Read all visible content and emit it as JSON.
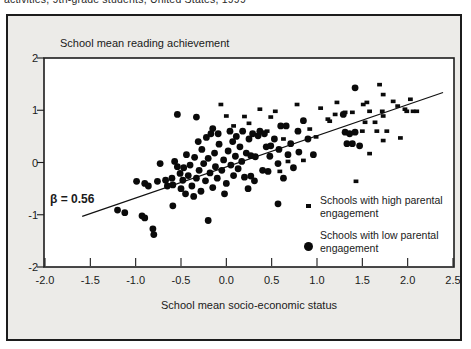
{
  "page": {
    "caption_clipped": "activities, 9th-grade students, United States, 1999"
  },
  "chart_ui": {
    "title": "School mean reading achievement",
    "x_axis_title": "School mean socio-economic status",
    "beta_annotation": "β = 0.56",
    "legend": [
      {
        "marker": "small-square",
        "line1": "Schools with high parental",
        "line2": "engagement"
      },
      {
        "marker": "large-circle",
        "line1": "Schools with low parental",
        "line2": "engagement"
      }
    ],
    "colors": {
      "box_background": "#ecebe8",
      "plot_background": "#ffffff",
      "marker": "#0a0a0a",
      "frame": "#1c1c1c"
    }
  },
  "chart_data": {
    "type": "scatter",
    "title": "School mean reading achievement",
    "xlabel": "School mean socio-economic status",
    "ylabel": "",
    "xlim": [
      -2.0,
      2.5
    ],
    "ylim": [
      -2,
      2
    ],
    "x_ticks": [
      -2.0,
      -1.5,
      -1.0,
      -0.5,
      0.0,
      0.5,
      1.0,
      1.5,
      2.0,
      2.5
    ],
    "x_tick_labels": [
      "-2.0",
      "-1.5",
      "-1.0",
      "-0.5",
      "0.0",
      "0.5",
      "1.0",
      "1.5",
      "2.0",
      "2.5"
    ],
    "y_ticks": [
      2,
      1,
      0,
      -1,
      -2
    ],
    "y_tick_labels": [
      "2",
      "1",
      "0",
      "-1",
      "-2"
    ],
    "grid": false,
    "legend_position": "inside-lower-right",
    "annotation": {
      "text": "β = 0.56",
      "x": -1.55,
      "y": -0.6
    },
    "regression_line": {
      "beta": 0.56,
      "x1": -1.59,
      "y1": -1.03,
      "x2": 2.39,
      "y2": 1.34
    },
    "series": [
      {
        "name": "Schools with high parental engagement",
        "marker": "square",
        "points": [
          [
            -0.06,
            1.11
          ],
          [
            0.0,
            0.89
          ],
          [
            0.08,
            0.7
          ],
          [
            0.2,
            0.88
          ],
          [
            0.25,
            0.75
          ],
          [
            0.37,
            1.02
          ],
          [
            0.45,
            0.6
          ],
          [
            0.49,
            0.87
          ],
          [
            0.54,
            0.98
          ],
          [
            0.59,
            -0.17
          ],
          [
            0.63,
            0.45
          ],
          [
            0.68,
            0.02
          ],
          [
            0.78,
            1.11
          ],
          [
            0.85,
            0.04
          ],
          [
            0.92,
            0.64
          ],
          [
            0.99,
            0.49
          ],
          [
            1.04,
            1.04
          ],
          [
            1.12,
            0.83
          ],
          [
            1.14,
            0.79
          ],
          [
            1.2,
            0.92
          ],
          [
            1.22,
            1.15
          ],
          [
            1.31,
            0.96
          ],
          [
            1.39,
            0.96
          ],
          [
            1.43,
            -0.36
          ],
          [
            1.5,
            0.6
          ],
          [
            1.51,
            1.11
          ],
          [
            1.53,
            0.77
          ],
          [
            1.55,
            1.15
          ],
          [
            1.58,
            0.98
          ],
          [
            1.58,
            0.17
          ],
          [
            1.64,
            0.77
          ],
          [
            1.66,
            0.6
          ],
          [
            1.69,
            1.49
          ],
          [
            1.72,
            0.98
          ],
          [
            1.73,
            0.89
          ],
          [
            1.73,
            0.42
          ],
          [
            1.73,
            1.3
          ],
          [
            1.77,
            0.6
          ],
          [
            1.84,
            1.17
          ],
          [
            1.89,
            1.08
          ],
          [
            1.92,
            0.47
          ],
          [
            1.97,
            1.02
          ],
          [
            1.99,
            0.98
          ],
          [
            2.03,
            1.21
          ],
          [
            2.06,
            0.98
          ],
          [
            2.1,
            0.98
          ]
        ]
      },
      {
        "name": "Schools with low parental engagement",
        "marker": "circle",
        "points": [
          [
            -1.2,
            -0.91
          ],
          [
            -1.12,
            -0.96
          ],
          [
            -0.99,
            -0.36
          ],
          [
            -0.93,
            -1.02
          ],
          [
            -0.9,
            -0.4
          ],
          [
            -0.9,
            -1.06
          ],
          [
            -0.86,
            -0.45
          ],
          [
            -0.81,
            -1.27
          ],
          [
            -0.8,
            -1.38
          ],
          [
            -0.76,
            -0.36
          ],
          [
            -0.73,
            -0.02
          ],
          [
            -0.67,
            -0.34
          ],
          [
            -0.65,
            -0.45
          ],
          [
            -0.6,
            -0.3
          ],
          [
            -0.59,
            -0.83
          ],
          [
            -0.59,
            -0.43
          ],
          [
            -0.57,
            0.02
          ],
          [
            -0.54,
            -0.08
          ],
          [
            -0.54,
            0.92
          ],
          [
            -0.51,
            -0.21
          ],
          [
            -0.5,
            -0.5
          ],
          [
            -0.48,
            -0.34
          ],
          [
            -0.47,
            -0.1
          ],
          [
            -0.45,
            -0.6
          ],
          [
            -0.44,
            0.15
          ],
          [
            -0.42,
            -0.25
          ],
          [
            -0.4,
            -0.05
          ],
          [
            -0.38,
            -0.45
          ],
          [
            -0.36,
            -0.65
          ],
          [
            -0.35,
            0.1
          ],
          [
            -0.33,
            0.87
          ],
          [
            -0.33,
            -0.3
          ],
          [
            -0.31,
            0.4
          ],
          [
            -0.3,
            -0.15
          ],
          [
            -0.28,
            -0.55
          ],
          [
            -0.27,
            0.25
          ],
          [
            -0.25,
            -0.02
          ],
          [
            -0.23,
            -0.35
          ],
          [
            -0.22,
            0.48
          ],
          [
            -0.2,
            0.08
          ],
          [
            -0.2,
            -1.11
          ],
          [
            -0.18,
            -0.2
          ],
          [
            -0.17,
            0.55
          ],
          [
            -0.15,
            -0.48
          ],
          [
            -0.15,
            0.65
          ],
          [
            -0.13,
            0.18
          ],
          [
            -0.12,
            -0.08
          ],
          [
            -0.1,
            -0.3
          ],
          [
            -0.09,
            0.55
          ],
          [
            -0.08,
            0.35
          ],
          [
            -0.05,
            -0.15
          ],
          [
            -0.03,
            0.05
          ],
          [
            -0.02,
            -0.6
          ],
          [
            0.0,
            -0.4
          ],
          [
            0.02,
            0.22
          ],
          [
            0.04,
            0.6
          ],
          [
            0.05,
            -0.05
          ],
          [
            0.07,
            0.4
          ],
          [
            0.08,
            -0.25
          ],
          [
            0.1,
            0.12
          ],
          [
            0.11,
            0.5
          ],
          [
            0.13,
            -0.12
          ],
          [
            0.15,
            0.3
          ],
          [
            0.17,
            0.02
          ],
          [
            0.18,
            0.6
          ],
          [
            0.2,
            -0.28
          ],
          [
            0.22,
            0.18
          ],
          [
            0.24,
            -0.5
          ],
          [
            0.25,
            0.45
          ],
          [
            0.27,
            -0.26
          ],
          [
            0.27,
            0.13
          ],
          [
            0.29,
            0.55
          ],
          [
            0.31,
            -0.35
          ],
          [
            0.32,
            0.11
          ],
          [
            0.35,
            0.51
          ],
          [
            0.37,
            0.6
          ],
          [
            0.4,
            -0.15
          ],
          [
            0.42,
            0.55
          ],
          [
            0.44,
            0.3
          ],
          [
            0.46,
            -0.17
          ],
          [
            0.48,
            0.12
          ],
          [
            0.49,
            0.32
          ],
          [
            0.53,
            0.45
          ],
          [
            0.57,
            -0.02
          ],
          [
            0.57,
            -0.79
          ],
          [
            0.58,
            0.25
          ],
          [
            0.6,
            0.7
          ],
          [
            0.63,
            -0.3
          ],
          [
            0.66,
            0.7
          ],
          [
            0.68,
            0.15
          ],
          [
            0.71,
            0.36
          ],
          [
            0.74,
            -0.1
          ],
          [
            0.79,
            0.6
          ],
          [
            0.8,
            0.2
          ],
          [
            0.85,
            0.8
          ],
          [
            0.9,
            0.45
          ],
          [
            0.96,
            0.15
          ],
          [
            1.29,
            0.92
          ],
          [
            1.31,
            0.58
          ],
          [
            1.33,
            0.36
          ],
          [
            1.36,
            0.55
          ],
          [
            1.39,
            0.36
          ],
          [
            1.42,
            0.58
          ],
          [
            1.42,
            1.43
          ],
          [
            1.47,
            0.32
          ]
        ]
      }
    ]
  }
}
